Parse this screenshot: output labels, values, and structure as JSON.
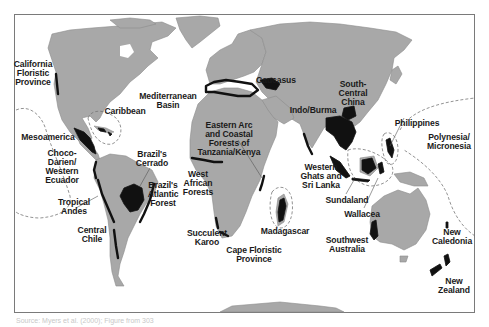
{
  "map": {
    "title": "Biodiversity hotspots world map",
    "colors": {
      "land": "#a8a8a8",
      "hotspot": "#111111",
      "ocean": "#ffffff",
      "frame": "#7a7a7a"
    },
    "hotspots": [
      {
        "id": "california",
        "label": "California\nFloristic\nProvince",
        "x": 2,
        "y": 60,
        "w": 62
      },
      {
        "id": "caribbean",
        "label": "Caribbean",
        "x": 98,
        "y": 107,
        "w": 54
      },
      {
        "id": "mesoamerica",
        "label": "Mesoamerica",
        "x": 14,
        "y": 133,
        "w": 68
      },
      {
        "id": "choco",
        "label": "Choco-\nDarien/\nWestern\nEcuador",
        "x": 38,
        "y": 149,
        "w": 48
      },
      {
        "id": "tropical-andes",
        "label": "Tropical\nAndes",
        "x": 50,
        "y": 198,
        "w": 48
      },
      {
        "id": "central-chile",
        "label": "Central\nChile",
        "x": 70,
        "y": 226,
        "w": 44
      },
      {
        "id": "cerrado",
        "label": "Brazil's\nCerrado",
        "x": 128,
        "y": 144,
        "w": 48
      },
      {
        "id": "atlantic-forest",
        "label": "Brazil's\nAtlantic\nForest",
        "x": 140,
        "y": 181,
        "w": 46
      },
      {
        "id": "mediterranean",
        "label": "Mediterranean\nBasin",
        "x": 130,
        "y": 79,
        "w": 76
      },
      {
        "id": "eastern-arc",
        "label": "Eastern Arc\nand Coastal\nForests of\nTanzania/Kenya",
        "x": 190,
        "y": 109,
        "w": 78
      },
      {
        "id": "west-african",
        "label": "West\nAfrican\nForests",
        "x": 176,
        "y": 170,
        "w": 44
      },
      {
        "id": "succulent-karoo",
        "label": "Succulent\nKaroo",
        "x": 180,
        "y": 209,
        "w": 54
      },
      {
        "id": "cape-floristic",
        "label": "Cape Floristic\nProvince",
        "x": 216,
        "y": 235,
        "w": 76
      },
      {
        "id": "madagascar",
        "label": "Madagascar",
        "x": 254,
        "y": 219,
        "w": 62
      },
      {
        "id": "caucasus",
        "label": "Caucasus",
        "x": 250,
        "y": 66,
        "w": 52
      },
      {
        "id": "south-central-china",
        "label": "South-\nCentral\nChina",
        "x": 332,
        "y": 66,
        "w": 42
      },
      {
        "id": "indo-burma",
        "label": "Indo/Burma",
        "x": 282,
        "y": 95,
        "w": 62
      },
      {
        "id": "western-ghats",
        "label": "Western\nGhats and\nSri Lanka",
        "x": 294,
        "y": 164,
        "w": 54
      },
      {
        "id": "sundaland",
        "label": "Sundaland",
        "x": 318,
        "y": 192,
        "w": 58
      },
      {
        "id": "wallacea",
        "label": "Wallacea",
        "x": 336,
        "y": 206,
        "w": 52
      },
      {
        "id": "philippines",
        "label": "Philippines",
        "x": 386,
        "y": 107,
        "w": 62
      },
      {
        "id": "polynesia",
        "label": "Polynesia/\nMicronesia",
        "x": 418,
        "y": 123,
        "w": 62
      },
      {
        "id": "southwest-australia",
        "label": "Southwest\nAustralia",
        "x": 320,
        "y": 236,
        "w": 54
      },
      {
        "id": "new-caledonia",
        "label": "New\nCaledonia",
        "x": 426,
        "y": 228,
        "w": 52
      },
      {
        "id": "new-zealand",
        "label": "New\nZealand",
        "x": 432,
        "y": 277,
        "w": 44
      }
    ]
  },
  "caption": "Source: Myers et al. (2000); Figure from 303"
}
